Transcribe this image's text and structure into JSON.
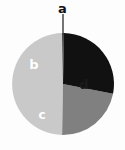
{
  "chart_data": {
    "type": "pie",
    "title": "",
    "subtitle": "",
    "xlabel": "",
    "ylabel": "",
    "legend_position": "none",
    "grid": false,
    "labels_inside": true,
    "total_degrees": 360,
    "categories": [
      "a",
      "b",
      "c",
      "d"
    ],
    "values": [
      2,
      100,
      80,
      178
    ],
    "series": [
      {
        "name": "slices",
        "values": [
          2,
          100,
          80,
          178
        ]
      }
    ],
    "slices": [
      {
        "label": "a",
        "value": 2,
        "degrees": 2,
        "percent": 0.6,
        "color": "#2b2b2b",
        "text_color": "#111111",
        "label_placement": "outside-callout",
        "has_leader_line": true
      },
      {
        "label": "b",
        "value": 100,
        "degrees": 100,
        "percent": 27.8,
        "color": "#111111",
        "text_color": "#ffffff",
        "label_placement": "inside",
        "has_leader_line": false
      },
      {
        "label": "c",
        "value": 80,
        "degrees": 80,
        "percent": 22.2,
        "color": "#808080",
        "text_color": "#ffffff",
        "label_placement": "inside",
        "has_leader_line": false
      },
      {
        "label": "d",
        "value": 178,
        "degrees": 178,
        "percent": 49.4,
        "color": "#c9c9c9",
        "text_color": "#1a1a1a",
        "label_placement": "inside",
        "has_leader_line": false
      }
    ],
    "colors": {
      "background": "#fdfdfd",
      "slice_a": "#2b2b2b",
      "slice_b": "#111111",
      "slice_c": "#808080",
      "slice_d": "#c9c9c9",
      "leader_line": "#3a3a3a",
      "label_light": "#ffffff",
      "label_dark": "#111111"
    },
    "geometry": {
      "center_x": 63,
      "center_y": 84,
      "radius": 51
    }
  },
  "labels": {
    "a": "a",
    "b": "b",
    "c": "c",
    "d": "d"
  }
}
